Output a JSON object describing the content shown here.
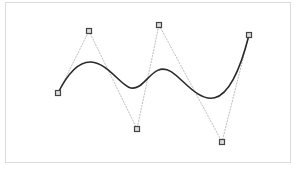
{
  "diagram": {
    "type": "b-spline-curve",
    "degree": 3,
    "control_points": [
      {
        "x": 58,
        "y": 93
      },
      {
        "x": 89,
        "y": 31
      },
      {
        "x": 137,
        "y": 129
      },
      {
        "x": 159,
        "y": 25
      },
      {
        "x": 222,
        "y": 142
      },
      {
        "x": 249,
        "y": 35
      }
    ],
    "colors": {
      "curve": "#2a2a2a",
      "control_polygon": "#bdbdbd",
      "control_point_fill": "#dddddd",
      "control_point_stroke": "#444444",
      "frame_border": "#dcdcdc"
    }
  }
}
